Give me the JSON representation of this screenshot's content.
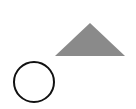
{
  "canvas": {
    "width": 136,
    "height": 109,
    "background": "#ffffff"
  },
  "shapes": {
    "triangle": {
      "points": "90,23 55,56 125,56",
      "fill": "#8a8a8a"
    },
    "circle": {
      "cx": "34",
      "cy": "82",
      "r": "20",
      "fill": "none",
      "stroke": "#111111",
      "stroke_width": "2"
    }
  }
}
